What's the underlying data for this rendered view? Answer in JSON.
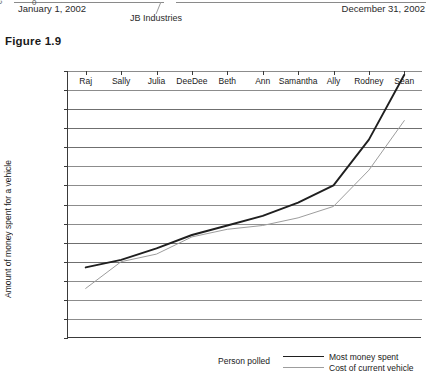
{
  "previous_figure_remnant": {
    "rotated_label": "e",
    "zero_tick": "0",
    "date_left": "January 1, 2002",
    "date_right": "December 31, 2002",
    "company": "JB Industries"
  },
  "figure": {
    "caption": "Figure 1.9"
  },
  "chart_data": {
    "type": "line",
    "title": "",
    "xlabel": "Person polled",
    "ylabel": "Amount of money spent for a vehicle",
    "categories": [
      "Raj",
      "Sally",
      "Julia",
      "DeeDee",
      "Beth",
      "Ann",
      "Samantha",
      "Ally",
      "Rodney",
      "Sean"
    ],
    "ylim": [
      0,
      70000
    ],
    "ytick_step": 5000,
    "ytick_labels": [
      "$70,000",
      "$65,000",
      "$60,000",
      "$55,000",
      "$50,000",
      "$45,000",
      "$40,000",
      "$35,000",
      "$30,000",
      "$25,000",
      "$20,000",
      "$15,000",
      "$10,000",
      "$5,000",
      "0"
    ],
    "grid": true,
    "legend_position": "bottom-right",
    "series": [
      {
        "name": "Most money spent",
        "color": "#1f1f1f",
        "width": 1.9,
        "values": [
          18500,
          20500,
          23500,
          27000,
          29500,
          32000,
          35500,
          40000,
          52000,
          69000
        ]
      },
      {
        "name": "Cost of current vehicle",
        "color": "#9d9d9d",
        "width": 1.0,
        "values": [
          13000,
          20000,
          22000,
          26500,
          28500,
          29500,
          31500,
          34500,
          44000,
          57000
        ]
      }
    ]
  }
}
